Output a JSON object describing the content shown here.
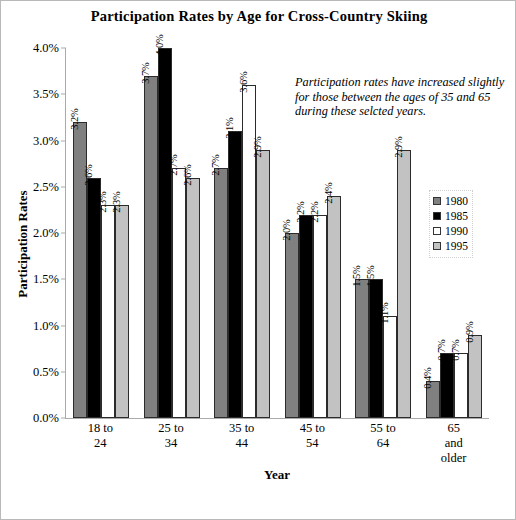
{
  "chart_data": {
    "type": "bar",
    "title": "Participation Rates by Age for Cross-Country Skiing",
    "xlabel": "Year",
    "ylabel": "Participation Rates",
    "ylim": [
      0,
      4.0
    ],
    "ytick_step": 0.5,
    "grid": false,
    "legend_position": "right-middle",
    "value_suffix": "%",
    "categories": [
      "18 to\n24",
      "25 to\n34",
      "35 to\n44",
      "45 to\n54",
      "55 to\n64",
      "65\nand\nolder"
    ],
    "yticks": [
      "0.0%",
      "0.5%",
      "1.0%",
      "1.5%",
      "2.0%",
      "2.5%",
      "3.0%",
      "3.5%",
      "4.0%"
    ],
    "ytick_values": [
      0.0,
      0.5,
      1.0,
      1.5,
      2.0,
      2.5,
      3.0,
      3.5,
      4.0
    ],
    "series": [
      {
        "name": "1980",
        "color": "#808080",
        "values": [
          3.2,
          3.7,
          2.7,
          2.0,
          1.5,
          0.4
        ],
        "labels": [
          "3.2%",
          "3.7%",
          "2.7%",
          "2.0%",
          "1.5%",
          "0.4%"
        ]
      },
      {
        "name": "1985",
        "color": "#000000",
        "values": [
          2.6,
          4.0,
          3.1,
          2.2,
          1.5,
          0.7
        ],
        "labels": [
          "2.6%",
          "4.0%",
          "3.1%",
          "2.2%",
          "1.5%",
          "0.7%"
        ]
      },
      {
        "name": "1990",
        "color": "#ffffff",
        "values": [
          2.3,
          2.7,
          3.6,
          2.2,
          1.1,
          0.7
        ],
        "labels": [
          "2.3%",
          "2.7%",
          "3.6%",
          "2.2%",
          "1.1%",
          "0.7%"
        ]
      },
      {
        "name": "1995",
        "color": "#c2c2c2",
        "values": [
          2.3,
          2.6,
          2.9,
          2.4,
          2.9,
          0.9
        ],
        "labels": [
          "2.3%",
          "2.6%",
          "2.9%",
          "2.4%",
          "2.9%",
          "0.9%"
        ]
      }
    ],
    "annotations": [
      {
        "text": "Participation rates have increased slightly for those between the ages of 35 and 65 during these selcted years.",
        "style": "italic"
      }
    ]
  }
}
